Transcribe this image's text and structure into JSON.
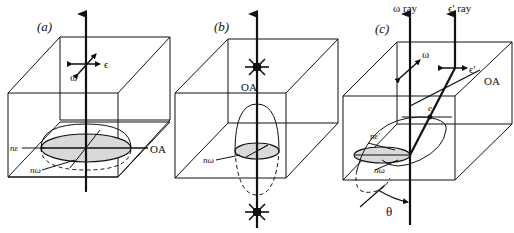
{
  "figure": {
    "panels": [
      {
        "id": "a",
        "label": "(a)",
        "polarization_labels": {
          "omega": "ω",
          "epsilon": "ϵ"
        },
        "axis_label": "OA",
        "index_labels": {
          "n_epsilon": "nε",
          "n_omega": "nω"
        }
      },
      {
        "id": "b",
        "label": "(b)",
        "axis_label": "OA",
        "index_labels": {
          "n_omega": "nω"
        }
      },
      {
        "id": "c",
        "label": "(c)",
        "ray_labels": {
          "omega_ray": "ω ray",
          "epsilon_prime_ray": "ϵ' ray"
        },
        "polarization_labels": {
          "omega": "ω",
          "epsilon_prime": "ϵ'"
        },
        "axis_label": "OA",
        "point_label": "e",
        "index_labels": {
          "n_epsilon_prime": "nε'",
          "n_omega": "nω"
        },
        "angle_label": "θ"
      }
    ],
    "colors": {
      "line": "#111111",
      "fill": "#d9d9d9",
      "background": "#ffffff"
    }
  }
}
